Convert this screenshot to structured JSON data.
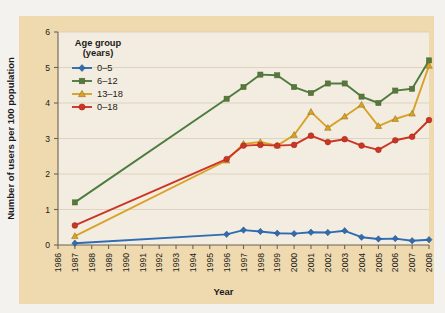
{
  "figure": {
    "background_color": "#f4f2ee",
    "mat_color": "#efd9ae",
    "plot_bg_color": "#f3ece0"
  },
  "axis": {
    "y_title": "Number of users per 100 population",
    "x_title": "Year",
    "y_ticks": [
      "0",
      "1",
      "2",
      "3",
      "4",
      "5",
      "6"
    ],
    "x_ticks": [
      "1986",
      "1987",
      "1988",
      "1989",
      "1990",
      "1991",
      "1992",
      "1993",
      "1994",
      "1995",
      "1996",
      "1997",
      "1998",
      "1999",
      "2000",
      "2001",
      "2002",
      "2003",
      "2004",
      "2005",
      "2006",
      "2007",
      "2008"
    ]
  },
  "legend": {
    "title_line1": "Age group",
    "title_line2": "(years)",
    "entries": [
      {
        "label": "0–5",
        "color": "#2f6cb2",
        "marker": "diamond"
      },
      {
        "label": "6–12",
        "color": "#4c7d3e",
        "marker": "square"
      },
      {
        "label": "13–18",
        "color": "#d9a227",
        "marker": "triangle"
      },
      {
        "label": "0–18",
        "color": "#cc3524",
        "marker": "circle"
      }
    ]
  },
  "chart_data": {
    "type": "line",
    "title": "",
    "xlabel": "Year",
    "ylabel": "Number of users per 100 population",
    "xlim": [
      1986,
      2008
    ],
    "ylim": [
      0,
      6
    ],
    "grid": true,
    "legend_position": "upper-left-inside",
    "x": [
      1986,
      1987,
      1988,
      1989,
      1990,
      1991,
      1992,
      1993,
      1994,
      1995,
      1996,
      1997,
      1998,
      1999,
      2000,
      2001,
      2002,
      2003,
      2004,
      2005,
      2006,
      2007,
      2008
    ],
    "series": [
      {
        "name": "0–5",
        "color": "#2f6cb2",
        "marker": "diamond",
        "x": [
          1987,
          1996,
          1997,
          1998,
          1999,
          2000,
          2001,
          2002,
          2003,
          2004,
          2005,
          2006,
          2007,
          2008
        ],
        "values": [
          0.05,
          0.3,
          0.42,
          0.38,
          0.33,
          0.32,
          0.36,
          0.35,
          0.4,
          0.22,
          0.17,
          0.18,
          0.12,
          0.15
        ]
      },
      {
        "name": "6–12",
        "color": "#4c7d3e",
        "marker": "square",
        "x": [
          1987,
          1996,
          1997,
          1998,
          1999,
          2000,
          2001,
          2002,
          2003,
          2004,
          2005,
          2006,
          2007,
          2008
        ],
        "values": [
          1.2,
          4.12,
          4.45,
          4.8,
          4.78,
          4.45,
          4.28,
          4.55,
          4.55,
          4.18,
          4.0,
          4.35,
          4.4,
          5.2
        ]
      },
      {
        "name": "13–18",
        "color": "#d9a227",
        "marker": "triangle",
        "x": [
          1987,
          1996,
          1997,
          1998,
          1999,
          2000,
          2001,
          2002,
          2003,
          2004,
          2005,
          2006,
          2007,
          2008
        ],
        "values": [
          0.25,
          2.38,
          2.85,
          2.9,
          2.8,
          3.1,
          3.75,
          3.3,
          3.62,
          3.95,
          3.35,
          3.55,
          3.7,
          5.05
        ]
      },
      {
        "name": "0–18",
        "color": "#cc3524",
        "marker": "circle",
        "x": [
          1987,
          1996,
          1997,
          1998,
          1999,
          2000,
          2001,
          2002,
          2003,
          2004,
          2005,
          2006,
          2007,
          2008
        ],
        "values": [
          0.55,
          2.42,
          2.8,
          2.82,
          2.8,
          2.82,
          3.08,
          2.9,
          2.98,
          2.8,
          2.68,
          2.95,
          3.05,
          3.52
        ]
      }
    ]
  }
}
